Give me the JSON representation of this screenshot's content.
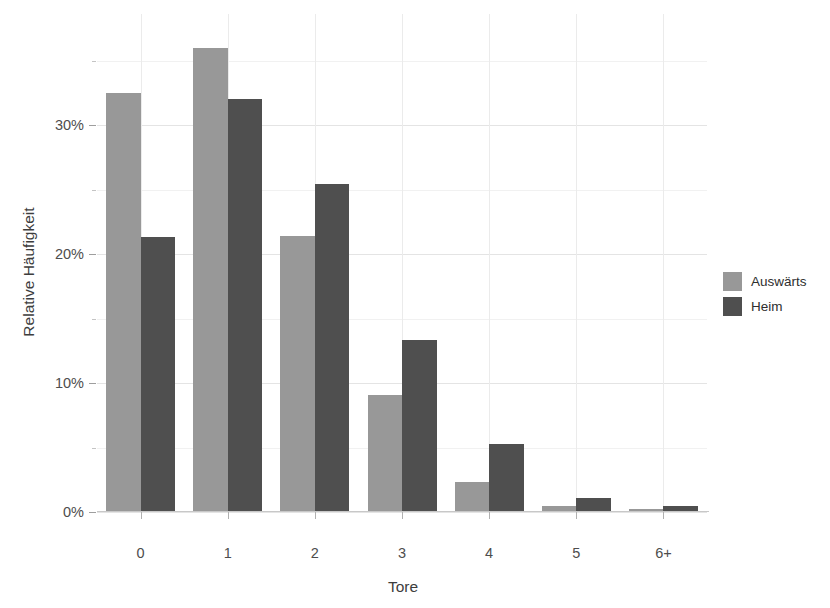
{
  "chart_data": {
    "type": "bar",
    "title": "",
    "subtitle": "",
    "xlabel": "Tore",
    "ylabel": "Relative Häufigkeit",
    "categories": [
      "0",
      "1",
      "2",
      "3",
      "4",
      "5",
      "6+"
    ],
    "series": [
      {
        "name": "Auswärts",
        "color": "#989898",
        "values": [
          32.5,
          36.0,
          21.4,
          9.1,
          2.3,
          0.5,
          0.2
        ]
      },
      {
        "name": "Heim",
        "color": "#4f4f4f",
        "values": [
          21.3,
          32.0,
          25.4,
          13.3,
          5.3,
          1.1,
          0.5
        ]
      }
    ],
    "ylim": [
      0,
      38
    ],
    "ytick_values": [
      0,
      10,
      20,
      30
    ],
    "ytick_labels": [
      "0%",
      "10%",
      "20%",
      "30%"
    ],
    "yminor_values": [
      5,
      15,
      25,
      35
    ],
    "grid": true,
    "grid_color": "#e6e6e6",
    "legend_position": "right",
    "legend_entries": [
      "Auswärts",
      "Heim"
    ],
    "value_unit": "%",
    "background": "#ffffff"
  }
}
